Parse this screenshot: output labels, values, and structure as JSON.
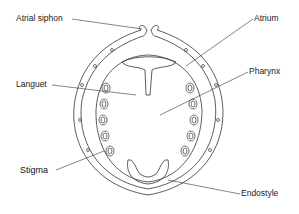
{
  "diagram": {
    "labels": [
      {
        "id": "atrial-siphon",
        "text": "Atrial siphon"
      },
      {
        "id": "atrium",
        "text": "Atrium"
      },
      {
        "id": "languet",
        "text": "Languet"
      },
      {
        "id": "pharynx",
        "text": "Pharynx"
      },
      {
        "id": "stigma",
        "text": "Stigma"
      },
      {
        "id": "endostyle",
        "text": "Endostyle"
      }
    ],
    "colors": {
      "line": "#333333",
      "background": "#ffffff",
      "text": "#222222"
    }
  }
}
